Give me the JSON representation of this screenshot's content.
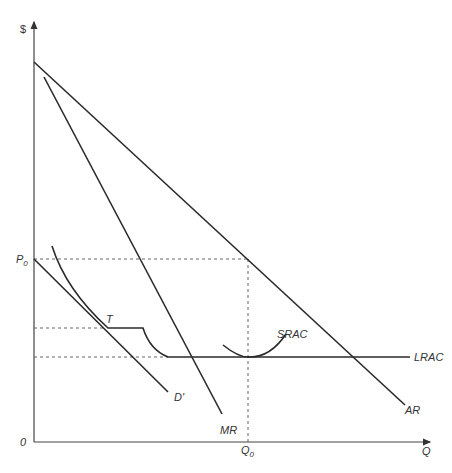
{
  "diagram": {
    "axes": {
      "y_label": "$",
      "x_label": "Q",
      "origin_label": "0"
    },
    "markers": {
      "price_label": "P",
      "price_sub": "0",
      "quantity_label": "Q",
      "quantity_sub": "0",
      "tangency_label": "T"
    },
    "curves": {
      "ar": "AR",
      "mr": "MR",
      "d_prime": "D'",
      "srac": "SRAC",
      "lrac": "LRAC"
    },
    "colors": {
      "line": "#2a2a2a",
      "axis": "#444444",
      "dashed": "#555555",
      "background": "#ffffff"
    }
  }
}
